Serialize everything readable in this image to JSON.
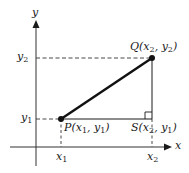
{
  "diagram": {
    "title": "",
    "axes": {
      "x_label": "x",
      "y_label": "y"
    },
    "points": [
      {
        "id": "P",
        "label": "P(x1, y1)",
        "name": "P",
        "coords": [
          "x1",
          "y1"
        ]
      },
      {
        "id": "Q",
        "label": "Q(x2, y2)",
        "name": "Q",
        "coords": [
          "x2",
          "y2"
        ]
      },
      {
        "id": "S",
        "label": "S(x2, y1)",
        "name": "S",
        "coords": [
          "x2",
          "y1"
        ]
      }
    ],
    "tick_labels": {
      "x1": "x1",
      "x2": "x2",
      "y1": "y1",
      "y2": "y2"
    },
    "label_parts": {
      "P": {
        "name": "P(",
        "a": "x",
        "a_sub": "1",
        "sep": ", ",
        "b": "y",
        "b_sub": "1",
        "close": ")"
      },
      "Q": {
        "name": "Q(",
        "a": "x",
        "a_sub": "2",
        "sep": ", ",
        "b": "y",
        "b_sub": "2",
        "close": ")"
      },
      "S": {
        "name": "S(",
        "a": "x",
        "a_sub": "2",
        "sep": ", ",
        "b": "y",
        "b_sub": "1",
        "close": ")"
      },
      "x1": {
        "base": "x",
        "sub": "1"
      },
      "x2": {
        "base": "x",
        "sub": "2"
      },
      "y1": {
        "base": "y",
        "sub": "1"
      },
      "y2": {
        "base": "y",
        "sub": "2"
      }
    },
    "colors": {
      "line": "#1a1a1a",
      "axis": "#333333",
      "dashed": "#333333",
      "background": "#ffffff"
    },
    "elements": {
      "segment_PQ": "solid thick line from P to Q",
      "segment_PS": "solid horizontal line from P to S",
      "segment_SQ": "solid vertical line from S to Q",
      "right_angle_marker": "at S",
      "dashed_guides": [
        "y2 to Q",
        "y1 to P",
        "P down to x1",
        "S down to x2"
      ]
    }
  }
}
